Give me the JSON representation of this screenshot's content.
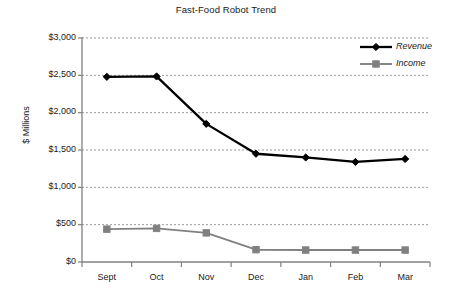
{
  "chart_data": {
    "type": "line",
    "title": "Fast-Food Robot Trend",
    "xlabel": "",
    "ylabel": "$ Millions",
    "categories": [
      "Sept",
      "Oct",
      "Nov",
      "Dec",
      "Jan",
      "Feb",
      "Mar"
    ],
    "series": [
      {
        "name": "Revenue",
        "color": "#000000",
        "marker": "diamond",
        "values": [
          2480,
          2485,
          1850,
          1450,
          1400,
          1340,
          1380
        ]
      },
      {
        "name": "Income",
        "color": "#808080",
        "marker": "square",
        "values": [
          440,
          450,
          390,
          165,
          160,
          160,
          160
        ]
      }
    ],
    "ylim": [
      0,
      3000
    ],
    "ytick_values": [
      0,
      500,
      1000,
      1500,
      2000,
      2500,
      3000
    ],
    "ytick_labels": [
      "$0",
      "$500",
      "$1,000",
      "$1,500",
      "$2,000",
      "$2,500",
      "$3,000"
    ],
    "grid": "horizontal-dashed",
    "legend_position": "top-right"
  },
  "axis_colors": {
    "axis_line": "#808080",
    "gridline": "#9a9a9a",
    "text": "#1a1a1a"
  }
}
